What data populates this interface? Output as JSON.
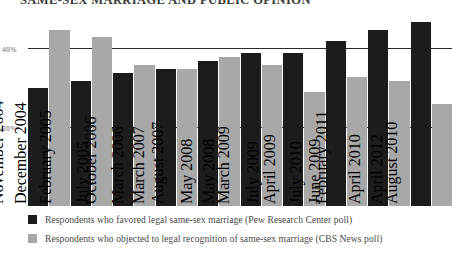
{
  "title": "SAME-SEX MARRIAGE AND PUBLIC OPINION",
  "chart_data": {
    "type": "bar",
    "title": "SAME-SEX MARRIAGE AND PUBLIC OPINION",
    "xlabel": "",
    "ylabel": "",
    "ylim": [
      0,
      50
    ],
    "yticks": [
      "20%",
      "40%"
    ],
    "ytick_values": [
      20,
      40
    ],
    "grid": true,
    "legend_position": "bottom",
    "categories": [
      "August 2004",
      "November 2004",
      "December 2004",
      "February 2005",
      "July 2005",
      "October 2006",
      "March 2006",
      "March 2007",
      "August 2007",
      "May 2008",
      "May 2008",
      "March 2009",
      "July 2009",
      "April 2009",
      "July 2010",
      "June 2009",
      "February 2011",
      "April 2010",
      "April 2012",
      "August 2010"
    ],
    "series": [
      {
        "name": "Respondents who favored legal same-sex marriage (Pew Research Center poll)",
        "color": "#1c1c1c",
        "points": [
          {
            "category": "August 2004",
            "value": 30
          },
          {
            "category": "December 2004",
            "value": 32
          },
          {
            "category": "July 2005",
            "value": 34
          },
          {
            "category": "March 2006",
            "value": 35
          },
          {
            "category": "March 2007",
            "value": 37
          },
          {
            "category": "May 2008",
            "value": 39
          },
          {
            "category": "March 2009",
            "value": 33
          },
          {
            "category": "July 2009",
            "value": 39
          },
          {
            "category": "June 2009",
            "value": 42
          },
          {
            "category": "February 2011",
            "value": 45
          },
          {
            "category": "April 2012",
            "value": 47
          }
        ]
      },
      {
        "name": "Respondents who objected to legal recognition of same-sex marriage (CBS News poll)",
        "color": "#a8a8a8",
        "points": [
          {
            "category": "November 2004",
            "value": 45
          },
          {
            "category": "February 2005",
            "value": 43
          },
          {
            "category": "October 2006",
            "value": 36
          },
          {
            "category": "March 2007",
            "value": 35
          },
          {
            "category": "August 2007",
            "value": 38
          },
          {
            "category": "May 2008",
            "value": 36
          },
          {
            "category": "April 2009",
            "value": 29
          },
          {
            "category": "July 2010",
            "value": 33
          },
          {
            "category": "April 2010",
            "value": 32
          },
          {
            "category": "August 2010",
            "value": 26
          }
        ]
      }
    ],
    "bars": [
      {
        "label": "August 2004",
        "series": "dark",
        "value": 30
      },
      {
        "label": "November 2004",
        "series": "light",
        "value": 45
      },
      {
        "label": "December 2004",
        "series": "dark",
        "value": 32
      },
      {
        "label": "February 2005",
        "series": "light",
        "value": 43
      },
      {
        "label": "July 2005",
        "series": "dark",
        "value": 34
      },
      {
        "label": "October 2006",
        "series": "light",
        "value": 36
      },
      {
        "label": "March 2006",
        "series": "dark",
        "value": 35
      },
      {
        "label": "March 2007",
        "series": "light",
        "value": 35
      },
      {
        "label": "August 2007",
        "series": "dark",
        "value": 37
      },
      {
        "label": "May 2008",
        "series": "light",
        "value": 38
      },
      {
        "label": "May 2008",
        "series": "dark",
        "value": 39
      },
      {
        "label": "March 2009",
        "series": "light",
        "value": 36
      },
      {
        "label": "July 2009",
        "series": "dark",
        "value": 39
      },
      {
        "label": "April 2009",
        "series": "light",
        "value": 29
      },
      {
        "label": "July 2010",
        "series": "dark",
        "value": 42
      },
      {
        "label": "June 2009",
        "series": "light",
        "value": 33
      },
      {
        "label": "February 2011",
        "series": "dark",
        "value": 45
      },
      {
        "label": "April 2010",
        "series": "light",
        "value": 32
      },
      {
        "label": "April 2012",
        "series": "dark",
        "value": 47
      },
      {
        "label": "August 2010",
        "series": "light",
        "value": 26
      }
    ]
  },
  "axis": {
    "top_label": "40%",
    "bottom_label": "20%"
  },
  "legend": [
    {
      "swatch": "dark",
      "text": "Respondents who favored legal same-sex marriage (Pew Research Center poll)"
    },
    {
      "swatch": "light",
      "text": "Respondents who objected to legal recognition of same-sex marriage (CBS News poll)"
    }
  ]
}
